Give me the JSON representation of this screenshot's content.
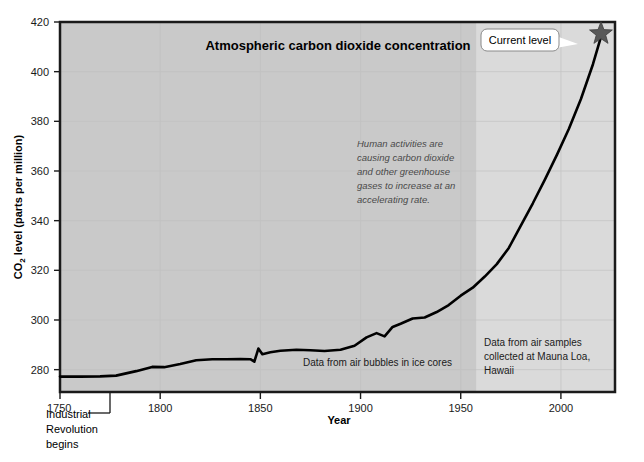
{
  "chart_data": {
    "type": "line",
    "title": "Atmospheric carbon dioxide concentration",
    "xlabel": "Year",
    "ylabel": "CO₂ level (parts per million)",
    "ylabel_main": "level (parts per million)",
    "ylabel_prefix": "CO",
    "ylabel_sub": "2",
    "xlim": [
      1750,
      2027
    ],
    "ylim": [
      271,
      420
    ],
    "xticks": [
      1750,
      1800,
      1850,
      1900,
      1950,
      2000
    ],
    "xtick_labels": [
      "1750",
      "1800",
      "1850",
      "1900",
      "1950",
      "2000"
    ],
    "yticks": [
      280,
      300,
      320,
      340,
      360,
      380,
      400,
      420
    ],
    "ytick_labels": [
      "280",
      "300",
      "320",
      "340",
      "360",
      "380",
      "400",
      "420"
    ],
    "grid": true,
    "legend": "none",
    "series": [
      {
        "name": "CO2 concentration",
        "color": "#000000",
        "x": [
          1750,
          1760,
          1770,
          1778,
          1788,
          1796,
          1802,
          1810,
          1818,
          1826,
          1833,
          1840,
          1845,
          1847,
          1849,
          1851,
          1855,
          1860,
          1868,
          1875,
          1882,
          1890,
          1897,
          1903,
          1908,
          1912,
          1916,
          1920,
          1926,
          1932,
          1938,
          1944,
          1950,
          1956,
          1962,
          1968,
          1974,
          1980,
          1986,
          1992,
          1998,
          2004,
          2010,
          2016,
          2020
        ],
        "y": [
          277.2,
          277.2,
          277.3,
          277.6,
          279.4,
          281.1,
          281.0,
          282.3,
          283.8,
          284.2,
          284.2,
          284.3,
          284.2,
          283.2,
          288.5,
          286.2,
          287.0,
          287.6,
          288.0,
          287.8,
          287.5,
          288.0,
          289.6,
          293.0,
          294.7,
          293.4,
          297.2,
          298.5,
          300.6,
          301.0,
          303.2,
          306.0,
          309.8,
          313.0,
          317.5,
          322.5,
          329.0,
          338.0,
          347.0,
          356.5,
          366.5,
          377.0,
          389.0,
          403.0,
          414.0
        ]
      }
    ],
    "marker": {
      "name": "current-level-star",
      "x": 2020,
      "y": 414.5,
      "label": "Current level",
      "color": "#585858"
    },
    "shaded_regions": [
      {
        "name": "ice-core-era",
        "from": 1750,
        "to": 1958,
        "color": "#c9c9c9"
      },
      {
        "name": "mauna-loa-era",
        "from": 1958,
        "to": 2027,
        "color": "#dadada"
      }
    ],
    "annotations": [
      {
        "name": "accelerating-rate-note",
        "text": "Human activities are causing carbon dioxide and other greenhouse gases to increase at an accelerating rate.",
        "lines": [
          "Human activities are",
          "causing carbon dioxide",
          "and other greenhouse",
          "gases to increase at an",
          "accelerating rate."
        ],
        "style": "italic"
      },
      {
        "name": "ice-core-source",
        "text": "Data from air bubbles in ice cores",
        "lines": [
          "Data from air bubbles in ice cores"
        ],
        "style": "normal"
      },
      {
        "name": "mauna-loa-source",
        "text": "Data from air samples collected at Mauna Loa, Hawaii",
        "lines": [
          "Data from air samples",
          "collected at Mauna Loa,",
          "Hawaii"
        ],
        "style": "normal"
      },
      {
        "name": "industrial-revolution-note",
        "text": "Industrial Revolution begins",
        "lines": [
          "Industrial",
          "Revolution",
          "begins"
        ],
        "style": "normal",
        "points_to_year": 1775
      }
    ],
    "colors": {
      "plot_background_left": "#c9c9c9",
      "plot_background_right": "#dadada",
      "line": "#000000",
      "frame": "#1a1a1a",
      "page_background": "#ffffff",
      "grid": "#bdbdbd",
      "star": "#585858",
      "italic_text": "#4a4a4a"
    }
  }
}
